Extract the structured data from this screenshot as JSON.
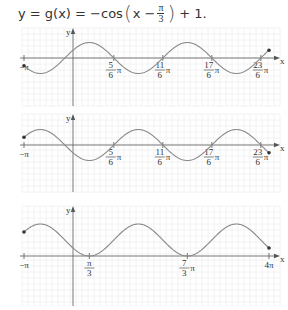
{
  "equation": {
    "lhs": "y = g(x) = −cos",
    "open_paren": "(",
    "inner": "x −",
    "frac_num": "π",
    "frac_den": "3",
    "close_paren": ")",
    "rhs": "+ 1."
  },
  "chart_data": [
    {
      "type": "line",
      "title": "",
      "function": "y = sin(x + π/6)",
      "xlabel": "x",
      "ylabel": "y",
      "xlim": [
        "-π",
        "4π"
      ],
      "amplitude": 1,
      "grid": true,
      "endpoints": [
        {
          "x": "-π",
          "y": -0.5
        },
        {
          "x": "4π",
          "y": 0.5
        }
      ],
      "x_ticks": [
        {
          "value": -3.14159,
          "label": "−π"
        },
        {
          "value": 2.61799,
          "num": "5",
          "den": "6",
          "suffix": "π"
        },
        {
          "value": 5.75959,
          "num": "11",
          "den": "6",
          "suffix": "π"
        },
        {
          "value": 8.90118,
          "num": "17",
          "den": "6",
          "suffix": "π"
        },
        {
          "value": 12.04277,
          "num": "23",
          "den": "6",
          "suffix": "π"
        }
      ]
    },
    {
      "type": "line",
      "title": "",
      "function": "y = −sin(x + π/6)",
      "xlabel": "x",
      "ylabel": "y",
      "xlim": [
        "-π",
        "4π"
      ],
      "amplitude": 1,
      "grid": true,
      "endpoints": [
        {
          "x": "-π",
          "y": 0.5
        },
        {
          "x": "4π",
          "y": -0.5
        }
      ],
      "x_ticks": [
        {
          "value": -3.14159,
          "label": "−π"
        },
        {
          "value": 2.61799,
          "num": "5",
          "den": "6",
          "suffix": "π"
        },
        {
          "value": 5.75959,
          "num": "11",
          "den": "6",
          "suffix": "π"
        },
        {
          "value": 8.90118,
          "num": "17",
          "den": "6",
          "suffix": "π"
        },
        {
          "value": 12.04277,
          "num": "23",
          "den": "6",
          "suffix": "π"
        }
      ]
    },
    {
      "type": "line",
      "title": "",
      "function": "y = −cos(x − π/3) + 1",
      "xlabel": "x",
      "ylabel": "y",
      "xlim": [
        "-π",
        "4π"
      ],
      "ylim": [
        0,
        2
      ],
      "grid": true,
      "endpoints": [
        {
          "x": "-π",
          "y": 1.5
        },
        {
          "x": "4π",
          "y": 0.5
        }
      ],
      "x_ticks": [
        {
          "value": -3.14159,
          "label": "−π"
        },
        {
          "value": 1.0472,
          "num": "π",
          "den": "3",
          "suffix": ""
        },
        {
          "value": 7.33038,
          "num": "7",
          "den": "3",
          "suffix": "π"
        },
        {
          "value": 12.56637,
          "label": "4π"
        }
      ]
    }
  ],
  "style": {
    "curve_color": "#8a8a8a",
    "axis_color": "#555555",
    "grid_color": "#f2f2f2",
    "dot_color": "#333333"
  }
}
